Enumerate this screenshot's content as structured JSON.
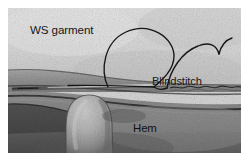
{
  "figure": {
    "kind": "photograph",
    "frame": {
      "x": 8,
      "y": 8,
      "width": 233,
      "height": 145,
      "page_background": "#ffffff"
    },
    "palette": {
      "page_background": "#ffffff",
      "garment_upper": "#d9d9d9",
      "garment_upper_shadow": "#b9b9b9",
      "hem_fabric": "#8e8e8e",
      "hem_fabric_dark": "#6e6e6e",
      "fold_shadow": "#4a4a4a",
      "thread": "#1b1b1b",
      "needle": "#2a2a2a",
      "needle_highlight": "#e2e2e2",
      "thumb": "#b2b2b2",
      "thumb_shadow": "#7a7a7a",
      "label_text": "#15161a"
    },
    "annotations": [
      {
        "id": "ws-garment",
        "text": "WS garment",
        "x": 22,
        "y": 26,
        "describes": "wrong side of the garment fabric, upper light area"
      },
      {
        "id": "blindstitch",
        "text": "Blindstitch",
        "x": 144,
        "y": 77,
        "describes": "the looping thread forming the blind stitch"
      },
      {
        "id": "hem",
        "text": "Hem",
        "x": 125,
        "y": 124,
        "describes": "folded hem allowance fabric, lower darker area"
      }
    ],
    "elements": [
      {
        "id": "thread-main-loop",
        "label": "large teardrop thread loop",
        "kind": "thread"
      },
      {
        "id": "thread-right-arc",
        "label": "secondary thread arc and tail",
        "kind": "thread"
      },
      {
        "id": "needle",
        "label": "sewing needle held flat in the fabric",
        "kind": "tool"
      },
      {
        "id": "thumb",
        "label": "thumb pressing the hem fold",
        "kind": "hand"
      },
      {
        "id": "stitch-line",
        "label": "wavy stitched fold edge at right",
        "kind": "stitching"
      }
    ]
  }
}
